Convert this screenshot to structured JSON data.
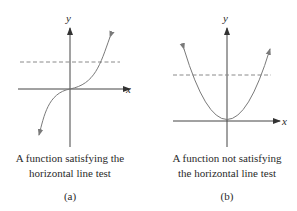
{
  "figures": [
    {
      "id": "a",
      "caption_line1": "A function satisfying the",
      "caption_line2": "horizontal line test",
      "label": "(a)",
      "x_axis_label": "x",
      "y_axis_label": "y",
      "curve": "cubic (one-to-one)",
      "dashed_line": "horizontal line crossing curve once"
    },
    {
      "id": "b",
      "caption_line1": "A function not satisfying",
      "caption_line2": "the horizontal line test",
      "label": "(b)",
      "x_axis_label": "x",
      "y_axis_label": "y",
      "curve": "parabola (not one-to-one)",
      "dashed_line": "horizontal line crossing curve twice"
    }
  ],
  "colors": {
    "axis": "#333333",
    "curve": "#7a7a7a",
    "dashed": "#8a8a8a",
    "text": "#2a2a2a"
  }
}
